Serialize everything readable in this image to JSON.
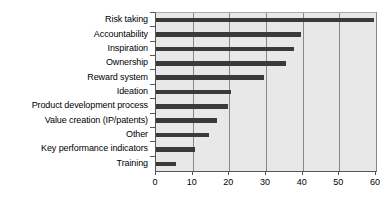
{
  "chart_data": {
    "type": "bar",
    "orientation": "horizontal",
    "title": "",
    "subtitle": "",
    "xlabel": "",
    "ylabel": "",
    "categories": [
      "Risk taking",
      "Accountability",
      "Inspiration",
      "Ownership",
      "Reward system",
      "Ideation",
      "Product development process",
      "Value creation (IP/patents)",
      "Other",
      "Key performance indicators",
      "Training"
    ],
    "values": [
      59.5,
      39.5,
      37.5,
      35.5,
      29.5,
      20.5,
      19.5,
      16.5,
      14.5,
      10.5,
      5.5
    ],
    "xlim": [
      0,
      60
    ],
    "xticks": [
      0,
      10,
      20,
      30,
      40,
      50,
      60
    ],
    "xtick_labels": [
      "0",
      "10",
      "20",
      "30",
      "40",
      "50",
      "60"
    ],
    "grid": "vertical",
    "legend": "none",
    "annotations": [],
    "colors": {
      "bar": "#3a3a3a",
      "plot_background": "#e8e8e8",
      "gridline": "#888888",
      "axis": "#555555",
      "text": "#000000",
      "page_background": "#ffffff"
    }
  }
}
